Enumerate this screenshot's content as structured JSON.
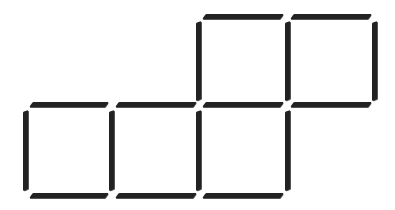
{
  "diagram": {
    "type": "matchstick-puzzle",
    "stick_color": "#222222",
    "background": "#ffffff",
    "squares_count": 5,
    "matchsticks_count": 16,
    "sticks": [
      {
        "id": "t1",
        "orient": "h",
        "x": 204,
        "y": 14,
        "len": 78
      },
      {
        "id": "t2",
        "orient": "h",
        "x": 292,
        "y": 14,
        "len": 78
      },
      {
        "id": "tv1",
        "orient": "v",
        "x": 196,
        "y": 22,
        "len": 78
      },
      {
        "id": "tv2",
        "orient": "v",
        "x": 285,
        "y": 22,
        "len": 78
      },
      {
        "id": "tv3",
        "orient": "v",
        "x": 372,
        "y": 22,
        "len": 78
      },
      {
        "id": "m1",
        "orient": "h",
        "x": 31,
        "y": 102,
        "len": 76
      },
      {
        "id": "m2",
        "orient": "h",
        "x": 117,
        "y": 102,
        "len": 78
      },
      {
        "id": "m3",
        "orient": "h",
        "x": 204,
        "y": 102,
        "len": 78
      },
      {
        "id": "m4",
        "orient": "h",
        "x": 292,
        "y": 102,
        "len": 78
      },
      {
        "id": "bv1",
        "orient": "v",
        "x": 23,
        "y": 111,
        "len": 79
      },
      {
        "id": "bv2",
        "orient": "v",
        "x": 109,
        "y": 111,
        "len": 79
      },
      {
        "id": "bv3",
        "orient": "v",
        "x": 196,
        "y": 111,
        "len": 79
      },
      {
        "id": "bv4",
        "orient": "v",
        "x": 285,
        "y": 111,
        "len": 79
      },
      {
        "id": "b1",
        "orient": "h",
        "x": 31,
        "y": 193,
        "len": 76
      },
      {
        "id": "b2",
        "orient": "h",
        "x": 117,
        "y": 193,
        "len": 78
      },
      {
        "id": "b3",
        "orient": "h",
        "x": 204,
        "y": 193,
        "len": 78
      }
    ]
  }
}
